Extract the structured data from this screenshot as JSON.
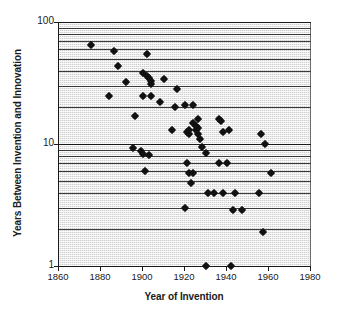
{
  "chart_data": {
    "type": "scatter",
    "title": "",
    "xlabel": "Year of Invention",
    "ylabel": "Years Between Invention and Innovation",
    "xlim": [
      1860,
      1980
    ],
    "ylim": [
      1,
      100
    ],
    "yscale": "log",
    "xscale": "linear",
    "grid": true,
    "grid_orientation": "horizontal",
    "legend": "none",
    "xticks": [
      1860,
      1880,
      1900,
      1920,
      1940,
      1960,
      1980
    ],
    "yticks": [
      1,
      10,
      100
    ],
    "marker": "diamond",
    "marker_color": "#111111",
    "plot_background": "#cfcfcf",
    "series": [
      {
        "name": "Invention-Innovation lag",
        "points": [
          [
            1875,
            65
          ],
          [
            1886,
            58
          ],
          [
            1888,
            44
          ],
          [
            1892,
            32
          ],
          [
            1884,
            25
          ],
          [
            1902,
            55
          ],
          [
            1900,
            38
          ],
          [
            1902,
            36
          ],
          [
            1903,
            35
          ],
          [
            1904,
            33
          ],
          [
            1904,
            31
          ],
          [
            1910,
            34
          ],
          [
            1896,
            17
          ],
          [
            1900,
            25
          ],
          [
            1904,
            25
          ],
          [
            1908,
            22
          ],
          [
            1915,
            20
          ],
          [
            1916,
            28
          ],
          [
            1920,
            21
          ],
          [
            1924,
            21
          ],
          [
            1914,
            13
          ],
          [
            1921,
            12.5
          ],
          [
            1922,
            12
          ],
          [
            1922,
            13
          ],
          [
            1924,
            15
          ],
          [
            1926,
            16
          ],
          [
            1925,
            14
          ],
          [
            1925,
            13
          ],
          [
            1926,
            13.5
          ],
          [
            1926,
            12
          ],
          [
            1927,
            11
          ],
          [
            1928,
            9.5
          ],
          [
            1921,
            7
          ],
          [
            1922,
            5.8
          ],
          [
            1924,
            5.8
          ],
          [
            1923,
            4.8
          ],
          [
            1930,
            8.5
          ],
          [
            1936,
            16
          ],
          [
            1937,
            15.5
          ],
          [
            1938,
            12.5
          ],
          [
            1941,
            13
          ],
          [
            1936,
            7
          ],
          [
            1940,
            7
          ],
          [
            1895,
            9.3
          ],
          [
            1899,
            8.8
          ],
          [
            1900,
            8.3
          ],
          [
            1903,
            8.2
          ],
          [
            1901,
            6
          ],
          [
            1931,
            4
          ],
          [
            1934,
            4
          ],
          [
            1938,
            4
          ],
          [
            1944,
            4
          ],
          [
            1955,
            4
          ],
          [
            1920,
            3
          ],
          [
            1943,
            2.9
          ],
          [
            1947,
            2.9
          ],
          [
            1956,
            12
          ],
          [
            1958,
            10
          ],
          [
            1961,
            5.8
          ],
          [
            1957,
            1.9
          ],
          [
            1930,
            1
          ],
          [
            1942,
            1
          ]
        ]
      }
    ]
  },
  "axis": {
    "y_label": "Years Between Invention and Innovation",
    "x_label": "Year of Invention",
    "y_tick_labels": [
      "100",
      "10",
      "1"
    ],
    "x_tick_labels": [
      "1860",
      "1880",
      "1900",
      "1920",
      "1940",
      "1960",
      "1980"
    ]
  }
}
